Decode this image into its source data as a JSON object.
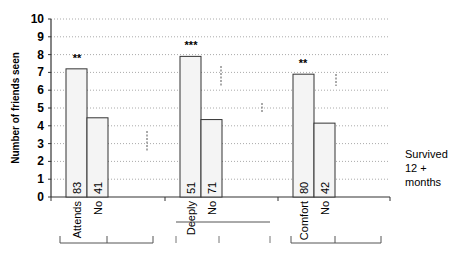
{
  "chart_data": {
    "type": "bar",
    "title": "",
    "xlabel": "",
    "ylabel": "Number of friends seen",
    "ylim": [
      0,
      10
    ],
    "yticks": [
      0,
      1,
      2,
      3,
      4,
      5,
      6,
      7,
      8,
      9,
      10
    ],
    "grid": "dotted horizontal",
    "legend": {
      "position": "right",
      "entries": [
        "Survived 12 + months"
      ]
    },
    "groups": [
      {
        "significance": "**",
        "bars": [
          {
            "label": "Attends",
            "value": 7.2,
            "n": "83"
          },
          {
            "label": "No",
            "value": 4.45,
            "n": "41"
          }
        ]
      },
      {
        "significance": "***",
        "bars": [
          {
            "label": "Deeply",
            "value": 7.9,
            "n": "51"
          },
          {
            "label": "No",
            "value": 4.35,
            "n": "71"
          }
        ]
      },
      {
        "significance": "**",
        "bars": [
          {
            "label": "Comfort",
            "value": 6.9,
            "n": "80"
          },
          {
            "label": "No",
            "value": 4.15,
            "n": "42"
          }
        ]
      }
    ],
    "categories": [
      "Attends",
      "No",
      "Deeply",
      "No",
      "Comfort",
      "No"
    ],
    "values": [
      7.2,
      4.45,
      7.9,
      4.35,
      6.9,
      4.15
    ],
    "sample_sizes": [
      "83",
      "41",
      "51",
      "71",
      "80",
      "42"
    ]
  },
  "labels": {
    "ylabel": "Number of friends seen",
    "legend_line1": "Survived",
    "legend_line2": "12 +",
    "legend_line3": "months"
  },
  "colors": {
    "bar_fill": "#f4f4f4",
    "bar_stroke": "#333333",
    "grid": "#aaaaaa",
    "axis": "#333333"
  }
}
